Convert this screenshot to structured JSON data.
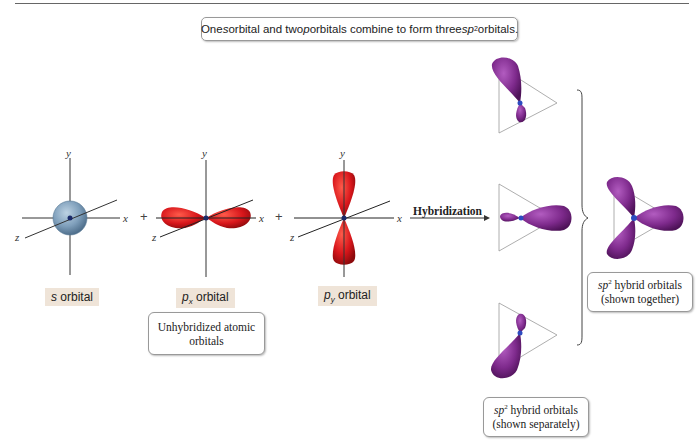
{
  "caption": {
    "prefix": "One ",
    "s": "s",
    "mid1": " orbital and two ",
    "p": "p",
    "mid2": " orbitals combine to form three ",
    "sp": "sp",
    "sup": "2",
    "suffix": " orbitals."
  },
  "axes": {
    "x": "x",
    "y": "y",
    "z": "z"
  },
  "operators": {
    "plus1": "+",
    "plus2": "+"
  },
  "orbitals": {
    "s": {
      "italic": "s",
      "label": " orbital",
      "color": "#7a9cb8"
    },
    "px": {
      "italic": "p",
      "sub": "x",
      "label": " orbital",
      "color": "#d8161b"
    },
    "py": {
      "italic": "p",
      "sub": "y",
      "label": " orbital",
      "color": "#d8161b"
    }
  },
  "unhybridized_note": {
    "line1": "Unhybridized atomic",
    "line2": "orbitals"
  },
  "arrow": {
    "label": "Hybridization"
  },
  "hybrid": {
    "color": "#7e2a8c",
    "separately_note": {
      "sp": "sp",
      "sup": "2",
      "line1_rest": " hybrid orbitals",
      "line2": "(shown separately)"
    },
    "together_note": {
      "sp": "sp",
      "sup": "2",
      "line1_rest": " hybrid orbitals",
      "line2": "(shown together)"
    }
  }
}
